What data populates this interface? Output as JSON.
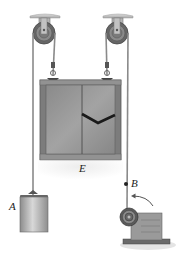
{
  "diagram": {
    "type": "pulley-system",
    "labels": {
      "box": "E",
      "block": "A",
      "point": "B"
    },
    "components": [
      {
        "name": "left-ceiling-pulley"
      },
      {
        "name": "right-ceiling-pulley"
      },
      {
        "name": "crate",
        "label": "E"
      },
      {
        "name": "counterweight-block",
        "label": "A"
      },
      {
        "name": "cable-point",
        "label": "B"
      },
      {
        "name": "motor-winch"
      }
    ],
    "colors": {
      "crate_fill": "#8f8f8f",
      "crate_frame": "#6e6e6e",
      "rope": "#8a8a8a",
      "pulley": "#5a5a5a",
      "block": "#b8b8b8",
      "ceiling": "#c8c8c8"
    }
  }
}
